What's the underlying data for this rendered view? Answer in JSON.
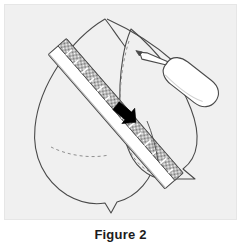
{
  "figure": {
    "caption": "Figure 2",
    "panel": {
      "background_color": "#f0f0f0",
      "border_color": "#e6e6e6"
    },
    "colors": {
      "outline": "#4a4a4a",
      "ruler_body": "#ffffff",
      "ruler_scale_band": "#8c8c8c",
      "tick_mark": "#ffffff",
      "arrow_marker": "#000000",
      "pen_body": "#ffffff",
      "dashed_guide": "#8f8f8f"
    },
    "objects": [
      {
        "name": "left-leaf",
        "label": "Left leaf outline with pointed tip",
        "style": "solid-outline"
      },
      {
        "name": "right-leaf",
        "label": "Right leaf outline with pointed tip",
        "style": "solid-outline"
      },
      {
        "name": "right-leaf-dashed-guide",
        "label": "Dashed inner curve on right leaf",
        "style": "dashed"
      },
      {
        "name": "left-leaf-dashed-guide",
        "label": "Dashed inner curve on left leaf",
        "style": "dashed"
      },
      {
        "name": "ruler",
        "label": "Ruler laid diagonally across the leaves",
        "orientation": "diagonal top-left to bottom-right",
        "tick_count": 14,
        "style": "white body with stippled gray scale band"
      },
      {
        "name": "arrow-marker",
        "label": "Black arrow marker on ruler edge",
        "direction": "down-right"
      },
      {
        "name": "pen",
        "label": "Pen / marker held with tip touching the ruler edge",
        "orientation": "tip down-left, body up-right"
      }
    ]
  }
}
